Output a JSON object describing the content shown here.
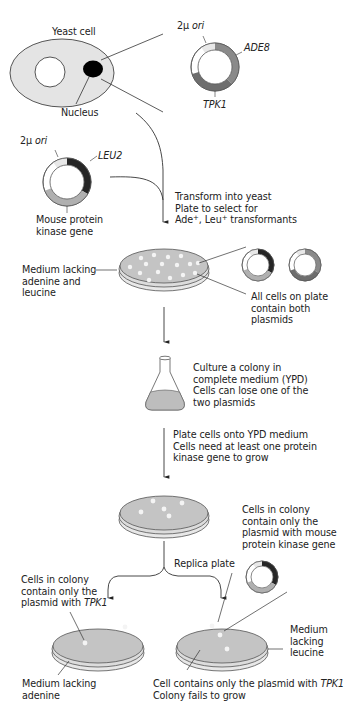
{
  "figure": {
    "colors": {
      "cell_fill": "#e4e4e4",
      "plate_fill": "#c4c4c4",
      "plate_rim": "#dcdcdc",
      "ori_segment": "#e8e8e8",
      "ade8_segment": "#8a8a8a",
      "tpk1_segment": "#6e6e6e",
      "leu2_segment": "#262626",
      "mouse_pk_segment": "#b0b0b0",
      "white_segment": "#ffffff",
      "nucleus": "#000000",
      "colony": "#f4f4f4",
      "flask_medium": "#bdbdbd"
    },
    "yeast_cell": {
      "title": "Yeast cell",
      "nucleus_label": "Nucleus"
    },
    "plasmid_tpk1": {
      "ori_label_prefix": "2μ",
      "ori_label_suffix": "ori",
      "gene_a": "ADE8",
      "gene_b": "TPK1"
    },
    "plasmid_leu2": {
      "ori_label_prefix": "2μ",
      "ori_label_suffix": "ori",
      "gene_a": "LEU2",
      "gene_b_line1": "Mouse protein",
      "gene_b_line2": "kinase gene"
    },
    "step_transform": {
      "line1": "Transform into yeast",
      "line2": "Plate to select for",
      "line3_a": "Ade",
      "line3_sup1": "+",
      "line3_b": ", Leu",
      "line3_sup2": "+",
      "line3_c": " transformants"
    },
    "plate1": {
      "medium_line1": "Medium lacking",
      "medium_line2": "adenine and",
      "medium_line3": "leucine",
      "note_line1": "All cells on plate",
      "note_line2": "contain both",
      "note_line3": "plasmids"
    },
    "step_culture": {
      "line1": "Culture a colony in",
      "line2": "complete medium (YPD)",
      "line3": "Cells can lose one of the",
      "line4": "two plasmids"
    },
    "step_plate_ypd": {
      "line1": "Plate cells onto YPD medium",
      "line2": "Cells need at least one protein",
      "line3": "kinase gene to grow"
    },
    "step_replica": {
      "label": "Replica plate"
    },
    "plate_left": {
      "note_line1": "Cells in colony",
      "note_line2": "contain only the",
      "note_line3_a": "plasmid with ",
      "note_line3_b": "TPK1",
      "medium_line1": "Medium lacking",
      "medium_line2": "adenine"
    },
    "plate_right": {
      "note_line1": "Cells in colony",
      "note_line2": "contain only the",
      "note_line3": "plasmid with mouse",
      "note_line4": "protein kinase gene",
      "medium_line1": "Medium",
      "medium_line2": "lacking",
      "medium_line3": "leucine",
      "fail_line1_a": "Cell contains only the plasmid with ",
      "fail_line1_b": "TPK1",
      "fail_line2": "Colony fails to grow"
    }
  }
}
